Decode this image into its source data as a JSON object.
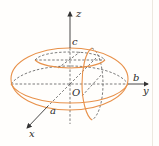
{
  "diagram": {
    "type": "ellipsoid",
    "colors": {
      "surface": "#e8914a",
      "axis": "#333333",
      "dashed": "#444444",
      "background": "#fffefc"
    },
    "labels": {
      "z_axis": "z",
      "y_axis": "y",
      "x_axis": "x",
      "origin": "O",
      "semi_axis_a": "a",
      "semi_axis_b": "b",
      "semi_axis_c": "c"
    }
  }
}
